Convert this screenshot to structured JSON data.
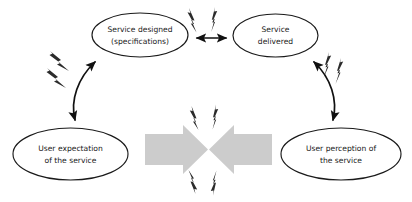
{
  "diagram": {
    "background_color": "#ffffff",
    "nodes": [
      {
        "id": "service-designed",
        "line1": "Service designed",
        "line2": "(specifications)",
        "cx": 140,
        "cy": 35,
        "rx": 48,
        "ry": 22
      },
      {
        "id": "service-delivered",
        "line1": "Service",
        "line2": "delivered",
        "cx": 275.5,
        "cy": 35.5,
        "rx": 42.5,
        "ry": 21.5
      },
      {
        "id": "user-expectation",
        "line1": "User expectation",
        "line2": "of the service",
        "cx": 70.5,
        "cy": 154,
        "rx": 57.5,
        "ry": 26
      },
      {
        "id": "user-perception",
        "line1": "User perception of",
        "line2": "the service",
        "cx": 341,
        "cy": 154,
        "rx": 60,
        "ry": 26
      }
    ],
    "connectors": [
      {
        "id": "designed-delivered",
        "kind": "double-headed-arrow",
        "orientation": "horizontal"
      },
      {
        "id": "expectation-designed",
        "kind": "double-headed-curved-arrow",
        "orientation": "left-diagonal"
      },
      {
        "id": "delivered-perception",
        "kind": "double-headed-curved-arrow",
        "orientation": "right-diagonal"
      }
    ],
    "clash": {
      "id": "central-clash",
      "left_arrow_direction": "right",
      "right_arrow_direction": "left",
      "fill_color": "#cccccc"
    },
    "bolt_clusters": [
      {
        "id": "bolts-top-center",
        "count": 2
      },
      {
        "id": "bolts-left",
        "count": 2
      },
      {
        "id": "bolts-right",
        "count": 2
      },
      {
        "id": "bolts-clash-top",
        "count": 2
      },
      {
        "id": "bolts-clash-bottom",
        "count": 2
      }
    ]
  }
}
